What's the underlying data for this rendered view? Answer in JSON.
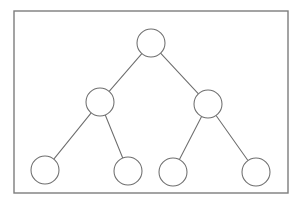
{
  "diagram": {
    "type": "node-link-tree",
    "background_color": "#ffffff",
    "frame": {
      "name": "border-frame",
      "x": 14,
      "y": 11,
      "width": 274,
      "height": 182,
      "stroke_color": "#7d7d7d",
      "fill_color": "#ffffff",
      "stroke_width": 1.4
    },
    "node_style": {
      "radius": 14,
      "stroke_color": "#6e6e6e",
      "fill_color": "#ffffff",
      "stroke_width": 1.05
    },
    "edge_style": {
      "stroke_color": "#6e6e6e",
      "stroke_width": 1.05
    },
    "nodes": [
      {
        "id": "root",
        "label": "",
        "level": 0,
        "cx": 151,
        "cy": 43,
        "r": 14
      },
      {
        "id": "left",
        "label": "",
        "level": 1,
        "cx": 100,
        "cy": 102,
        "r": 14
      },
      {
        "id": "right",
        "label": "",
        "level": 1,
        "cx": 208,
        "cy": 104,
        "r": 14
      },
      {
        "id": "leaf1",
        "label": "",
        "level": 2,
        "cx": 45,
        "cy": 170,
        "r": 14
      },
      {
        "id": "leaf2",
        "label": "",
        "level": 2,
        "cx": 128,
        "cy": 171,
        "r": 14
      },
      {
        "id": "leaf3",
        "label": "",
        "level": 2,
        "cx": 173,
        "cy": 172,
        "r": 14
      },
      {
        "id": "leaf4",
        "label": "",
        "level": 2,
        "cx": 256,
        "cy": 172,
        "r": 14
      }
    ],
    "edges": [
      {
        "id": "root-left",
        "from": "root",
        "to": "left"
      },
      {
        "id": "root-right",
        "from": "root",
        "to": "right"
      },
      {
        "id": "left-leaf1",
        "from": "left",
        "to": "leaf1"
      },
      {
        "id": "left-leaf2",
        "from": "left",
        "to": "leaf2"
      },
      {
        "id": "right-leaf3",
        "from": "right",
        "to": "leaf3"
      },
      {
        "id": "right-leaf4",
        "from": "right",
        "to": "leaf4"
      }
    ]
  }
}
